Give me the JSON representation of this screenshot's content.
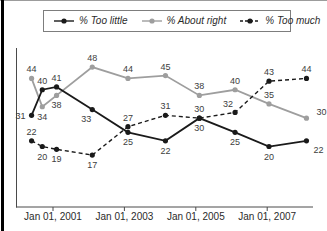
{
  "frame": {
    "background": "#ffffff",
    "left_bar_color": "#000000",
    "top_line_color": "#9c9c9c"
  },
  "legend": {
    "border_color": "#7d7d7d",
    "items": [
      {
        "label": "% Too little"
      },
      {
        "label": "% About right"
      },
      {
        "label": "% Too much"
      }
    ]
  },
  "chart_data": {
    "type": "line",
    "title": "",
    "xlabel": "",
    "ylabel": "",
    "grid": false,
    "legend_position": "top",
    "x": [
      2000.4,
      2000.7,
      2001.1,
      2002.1,
      2003.1,
      2004.15,
      2005.1,
      2006.1,
      2007.05,
      2008.1
    ],
    "x_tick_values": [
      2001,
      2003,
      2005,
      2007
    ],
    "x_tick_labels": [
      "Jan 01, 2001",
      "Jan 01, 2003",
      "Jan 01, 2005",
      "Jan 01, 2007"
    ],
    "ylim": [
      0,
      55
    ],
    "axis_color": "#4a4a4a",
    "value_label_color": "#3d3d3d",
    "series": [
      {
        "name": "% Too little",
        "color": "#1a1a1a",
        "dash": "solid",
        "values": [
          31,
          40,
          41,
          33,
          25,
          22,
          30,
          25,
          20,
          22
        ],
        "label_pos": [
          "l",
          "t",
          "t",
          "bl",
          "b",
          "b",
          "b",
          "b",
          "b",
          "br"
        ]
      },
      {
        "name": "% About right",
        "color": "#9e9e9e",
        "dash": "solid",
        "values": [
          44,
          34,
          38,
          48,
          44,
          45,
          38,
          40,
          35,
          30
        ],
        "label_pos": [
          "t",
          "b",
          "b",
          "t",
          "t",
          "t",
          "t",
          "t",
          "t",
          "tr"
        ]
      },
      {
        "name": "% Too much",
        "color": "#1a1a1a",
        "dash": "dashed",
        "values": [
          22,
          20,
          19,
          17,
          27,
          31,
          30,
          32,
          43,
          44
        ],
        "label_pos": [
          "t",
          "b",
          "b",
          "b",
          "t",
          "t",
          "t",
          "tl",
          "t",
          "t"
        ]
      }
    ]
  }
}
